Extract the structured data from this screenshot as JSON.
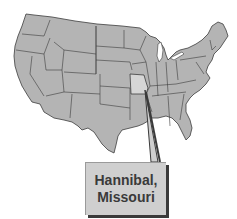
{
  "map": {
    "title": "United States",
    "highlighted_state": "Missouri",
    "colors": {
      "land": "#b4b4b4",
      "border": "#3c3c3c",
      "highlight": "#d6d6d6",
      "label_bg": "#cfcfcf",
      "label_text": "#3a3a3a",
      "background": "#ffffff"
    }
  },
  "callout": {
    "line1": "Hannibal,",
    "line2": "Missouri"
  }
}
